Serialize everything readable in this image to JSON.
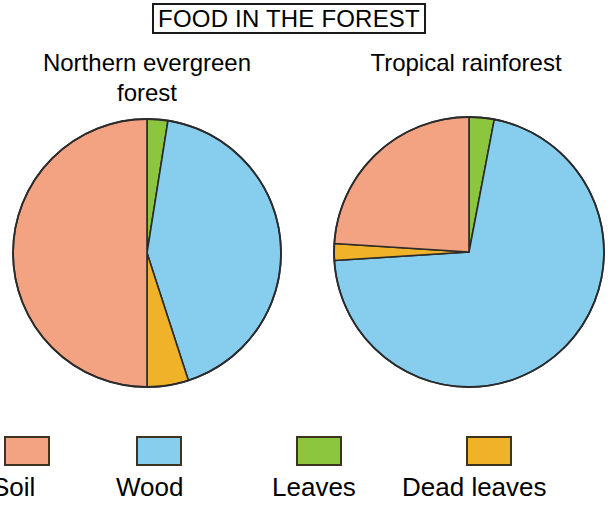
{
  "title": "FOOD IN THE FOREST",
  "charts": [
    {
      "caption": "Northern evergreen\nforest",
      "cx": 147,
      "cy": 253,
      "r": 134
    },
    {
      "caption": "Tropical rainforest",
      "cx": 469,
      "cy": 252,
      "r": 135
    }
  ],
  "legend": {
    "items": [
      {
        "label": "Soil",
        "color": "#f3a282"
      },
      {
        "label": "Wood",
        "color": "#87cdee"
      },
      {
        "label": "Leaves",
        "color": "#8cc63e"
      },
      {
        "label": "Dead leaves",
        "color": "#f0b228"
      }
    ]
  },
  "colors": {
    "soil": "#f3a282",
    "wood": "#87cdee",
    "leaves": "#8cc63e",
    "dead_leaves": "#f0b228",
    "outline": "#2b2b2b",
    "background": "#ffffff",
    "text": "#000000"
  },
  "chart_data": [
    {
      "type": "pie",
      "title": "Northern evergreen forest",
      "categories": [
        "Leaves",
        "Wood",
        "Dead leaves",
        "Soil"
      ],
      "values": [
        2.5,
        42.5,
        5,
        50
      ],
      "colors": [
        "#8cc63e",
        "#87cdee",
        "#f0b228",
        "#f3a282"
      ],
      "start_angle_deg": 0,
      "direction": "clockwise",
      "legend_position": "bottom",
      "units": "percent"
    },
    {
      "type": "pie",
      "title": "Tropical rainforest",
      "categories": [
        "Leaves",
        "Wood",
        "Dead leaves",
        "Soil"
      ],
      "values": [
        3,
        71,
        2,
        24
      ],
      "colors": [
        "#8cc63e",
        "#87cdee",
        "#f0b228",
        "#f3a282"
      ],
      "start_angle_deg": 0,
      "direction": "clockwise",
      "legend_position": "bottom",
      "units": "percent"
    }
  ]
}
